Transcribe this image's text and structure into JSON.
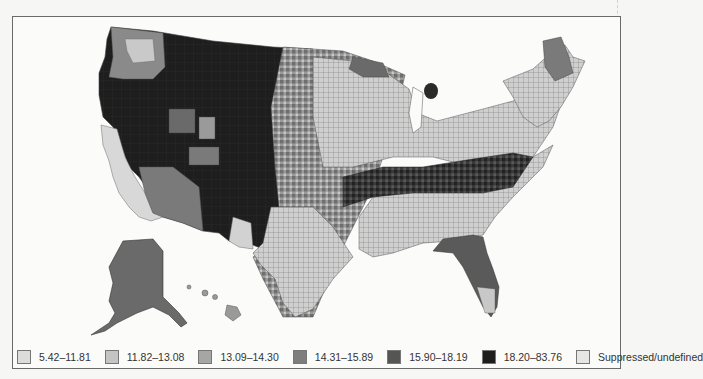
{
  "map": {
    "title": "",
    "regions_shown": [
      "Contiguous United States",
      "Alaska",
      "Hawaii"
    ],
    "description": "County-level choropleth of the United States in grayscale classes"
  },
  "legend": {
    "items": [
      {
        "label": "5.42–11.81",
        "color": "#dcdcdc"
      },
      {
        "label": "11.82–13.08",
        "color": "#c4c4c4"
      },
      {
        "label": "13.09–14.30",
        "color": "#a6a6a6"
      },
      {
        "label": "14.31–15.89",
        "color": "#7e7e7e"
      },
      {
        "label": "15.90–18.19",
        "color": "#555555"
      },
      {
        "label": "18.20–83.76",
        "color": "#1e1e1e"
      },
      {
        "label": "Suppressed/undefined",
        "color": "#e6e6e6"
      }
    ]
  },
  "colors": {
    "frame_border": "#6a6a6a",
    "background": "#fbfbfa",
    "county_border": "#5a5a5a"
  }
}
